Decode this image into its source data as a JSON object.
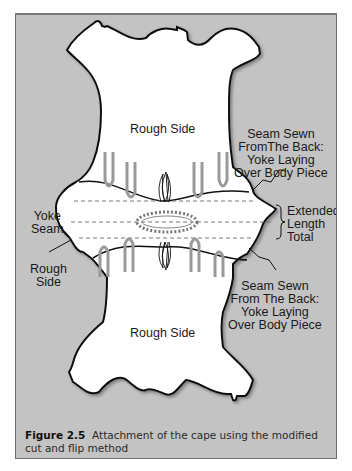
{
  "figure": {
    "number_label": "Figure 2.5",
    "caption_text": "Attachment of the cape using the modified cut and flip method"
  },
  "labels": {
    "top_rough_side": "Rough Side",
    "bottom_rough_side": "Rough Side",
    "left_yoke_seam": [
      "Yoke",
      "Seam"
    ],
    "left_rough_side": [
      "Rough",
      "Side"
    ],
    "upper_seam_note": [
      "Seam Sewn",
      "FromThe Back:",
      "Yoke Laying",
      "Over Body Piece"
    ],
    "lower_seam_note": [
      "Seam Sewn",
      "From The Back:",
      "Yoke Laying",
      "Over Body Piece"
    ],
    "extended_length": [
      "Extended",
      "Length",
      "Total"
    ]
  },
  "colors": {
    "background_panel": "#c3c3c3",
    "hide_fill": "#ffffff",
    "outline": "#111111",
    "stitch_gray": "#9a9a9a"
  }
}
